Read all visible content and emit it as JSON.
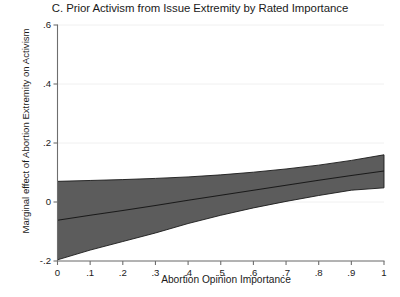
{
  "chart_data": {
    "type": "area",
    "title": "C. Prior Activism from Issue Extremity by Rated Importance",
    "xlabel": "Abortion Opinion Importance",
    "ylabel": "Marginal effect of Abortion Extremity on Activism",
    "xlim": [
      0,
      1
    ],
    "ylim": [
      -0.2,
      0.6
    ],
    "xticks": [
      0,
      0.1,
      0.2,
      0.3,
      0.4,
      0.5,
      0.6,
      0.7,
      0.8,
      0.9,
      1
    ],
    "xtick_labels": [
      "0",
      ".1",
      ".2",
      ".3",
      ".4",
      ".5",
      ".6",
      ".7",
      ".8",
      ".9",
      "1"
    ],
    "yticks": [
      -0.2,
      0,
      0.2,
      0.4,
      0.6
    ],
    "ytick_labels": [
      "-.2",
      "0",
      ".2",
      ".4",
      ".6"
    ],
    "grid": true,
    "grid_axis": "y",
    "grid_color": "#f0f0f0",
    "legend": null,
    "band_color": "#5c5c5c",
    "line_color": "#1a1a1a",
    "x": [
      0,
      0.1,
      0.2,
      0.3,
      0.4,
      0.5,
      0.6,
      0.7,
      0.8,
      0.9,
      1
    ],
    "series": [
      {
        "name": "Marginal effect (point estimate)",
        "values": [
          -0.062,
          -0.045,
          -0.029,
          -0.012,
          0.006,
          0.023,
          0.04,
          0.057,
          0.074,
          0.09,
          0.105
        ]
      },
      {
        "name": "95% CI upper bound",
        "values": [
          0.07,
          0.073,
          0.076,
          0.08,
          0.085,
          0.092,
          0.101,
          0.112,
          0.125,
          0.141,
          0.16
        ]
      },
      {
        "name": "95% CI lower bound",
        "values": [
          -0.196,
          -0.163,
          -0.134,
          -0.105,
          -0.073,
          -0.045,
          -0.02,
          0.002,
          0.022,
          0.04,
          0.048
        ]
      }
    ]
  }
}
